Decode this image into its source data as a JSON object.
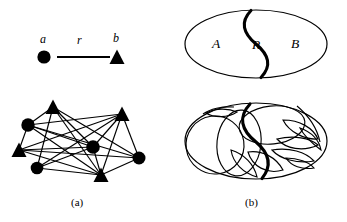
{
  "figure": {
    "background_color": "#ffffff",
    "ink_color": "#000000",
    "width": 347,
    "height": 222,
    "captions": [
      {
        "id": "cap-a",
        "text": "(a)"
      },
      {
        "id": "cap-b",
        "text": "(b)"
      }
    ]
  },
  "panel_a": {
    "name": "relation-and-graph-panel",
    "relation_example": {
      "labels": {
        "source": "a",
        "relation": "r",
        "target": "b"
      },
      "source_shape": "circle",
      "target_shape": "triangle",
      "edge": "solid-line"
    },
    "graph": {
      "node_shapes": [
        "circle",
        "triangle"
      ],
      "circle_count": 4,
      "triangle_count": 4,
      "nodes": [
        {
          "id": "n1",
          "shape": "triangle",
          "x": 53,
          "y": 107
        },
        {
          "id": "n2",
          "shape": "circle",
          "x": 28,
          "y": 125
        },
        {
          "id": "n3",
          "shape": "triangle",
          "x": 19,
          "y": 150
        },
        {
          "id": "n4",
          "shape": "circle",
          "x": 37,
          "y": 168
        },
        {
          "id": "n5",
          "shape": "circle",
          "x": 93,
          "y": 147
        },
        {
          "id": "n6",
          "shape": "triangle",
          "x": 101,
          "y": 175
        },
        {
          "id": "n7",
          "shape": "triangle",
          "x": 122,
          "y": 114
        },
        {
          "id": "n8",
          "shape": "circle",
          "x": 139,
          "y": 158
        }
      ],
      "edges": [
        [
          "n1",
          "n2"
        ],
        [
          "n1",
          "n4"
        ],
        [
          "n1",
          "n5"
        ],
        [
          "n1",
          "n6"
        ],
        [
          "n1",
          "n8"
        ],
        [
          "n2",
          "n3"
        ],
        [
          "n2",
          "n5"
        ],
        [
          "n2",
          "n7"
        ],
        [
          "n2",
          "n8"
        ],
        [
          "n3",
          "n5"
        ],
        [
          "n3",
          "n7"
        ],
        [
          "n3",
          "n8"
        ],
        [
          "n4",
          "n5"
        ],
        [
          "n4",
          "n7"
        ],
        [
          "n4",
          "n8"
        ],
        [
          "n5",
          "n6"
        ],
        [
          "n5",
          "n7"
        ],
        [
          "n6",
          "n7"
        ],
        [
          "n6",
          "n8"
        ],
        [
          "n7",
          "n8"
        ],
        [
          "n3",
          "n6"
        ],
        [
          "n2",
          "n6"
        ]
      ]
    }
  },
  "panel_b": {
    "name": "partitioned-ellipse-panel",
    "top_ellipse": {
      "labels": {
        "left_region": "A",
        "middle_region": "R",
        "right_region": "B"
      },
      "divider": "thick-s-curve",
      "cx": 256,
      "cy": 44,
      "rx": 71,
      "ry": 34
    },
    "bottom_ellipse": {
      "divider": "thick-s-curve",
      "cell_count": 12,
      "cx": 256,
      "cy": 141,
      "rx": 71,
      "ry": 38
    }
  }
}
